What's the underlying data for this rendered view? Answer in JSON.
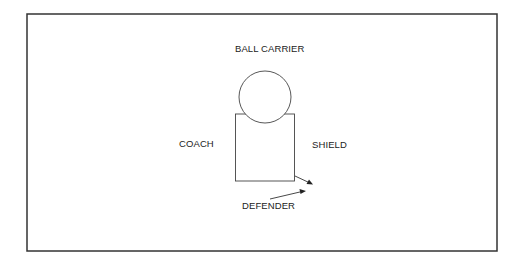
{
  "diagram": {
    "labels": {
      "ball_carrier": "BALL CARRIER",
      "coach": "COACH",
      "shield": "SHIELD",
      "defender": "DEFENDER"
    },
    "colors": {
      "stroke": "#333333",
      "background": "#ffffff"
    }
  }
}
